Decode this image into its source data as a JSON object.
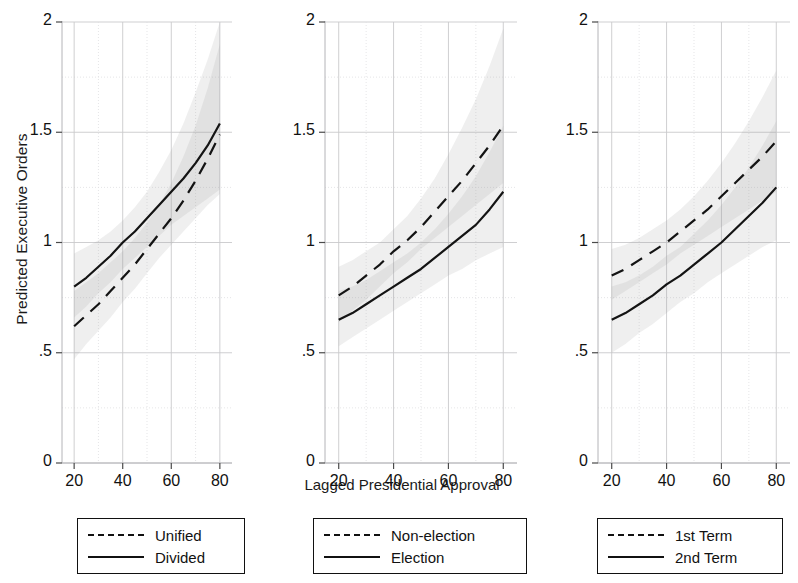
{
  "chart_data": {
    "type": "line",
    "title": "",
    "xlabel": "Lagged Presidential Approval",
    "ylabel": "Predicted Executive Orders",
    "xlim": [
      15,
      85
    ],
    "ylim": [
      0,
      2
    ],
    "xticks": [
      20,
      40,
      60,
      80
    ],
    "xtick_labels": [
      "20",
      "40",
      "60",
      "80"
    ],
    "yticks": [
      0,
      0.5,
      1,
      1.5,
      2
    ],
    "ytick_labels": [
      "0",
      ".5",
      "1",
      "1.5",
      "2"
    ],
    "grid": true,
    "legend_position": "below-each-panel",
    "panel_count": 3,
    "x": [
      20,
      25,
      30,
      35,
      40,
      45,
      50,
      55,
      60,
      65,
      70,
      75,
      80
    ],
    "panels": [
      {
        "name": "government-control",
        "legend": [
          {
            "label": "Unified",
            "style": "dashed"
          },
          {
            "label": "Divided",
            "style": "solid"
          }
        ],
        "series": [
          {
            "name": "Unified",
            "style": "dashed",
            "values": [
              0.62,
              0.67,
              0.72,
              0.78,
              0.84,
              0.9,
              0.97,
              1.04,
              1.11,
              1.19,
              1.28,
              1.38,
              1.49
            ],
            "ci_lower": [
              0.47,
              0.54,
              0.6,
              0.66,
              0.73,
              0.79,
              0.86,
              0.93,
              0.99,
              1.05,
              1.11,
              1.17,
              1.22
            ],
            "ci_upper": [
              0.78,
              0.82,
              0.86,
              0.91,
              0.96,
              1.02,
              1.09,
              1.17,
              1.27,
              1.39,
              1.53,
              1.7,
              1.9
            ]
          },
          {
            "name": "Divided",
            "style": "solid",
            "values": [
              0.8,
              0.84,
              0.89,
              0.94,
              1.0,
              1.05,
              1.11,
              1.17,
              1.23,
              1.29,
              1.36,
              1.44,
              1.54
            ],
            "ci_lower": [
              0.66,
              0.71,
              0.77,
              0.82,
              0.88,
              0.93,
              0.98,
              1.03,
              1.08,
              1.12,
              1.16,
              1.2,
              1.24
            ],
            "ci_upper": [
              0.95,
              0.98,
              1.01,
              1.05,
              1.1,
              1.16,
              1.23,
              1.32,
              1.42,
              1.54,
              1.68,
              1.83,
              2.0
            ]
          }
        ]
      },
      {
        "name": "election-year",
        "legend": [
          {
            "label": "Non-election",
            "style": "dashed"
          },
          {
            "label": "Election",
            "style": "solid"
          }
        ],
        "series": [
          {
            "name": "Non-election",
            "style": "dashed",
            "values": [
              0.76,
              0.8,
              0.85,
              0.9,
              0.96,
              1.01,
              1.07,
              1.14,
              1.21,
              1.28,
              1.36,
              1.44,
              1.53
            ],
            "ci_lower": [
              0.64,
              0.69,
              0.74,
              0.8,
              0.86,
              0.91,
              0.97,
              1.02,
              1.07,
              1.12,
              1.17,
              1.22,
              1.27
            ],
            "ci_upper": [
              0.89,
              0.92,
              0.96,
              1.0,
              1.06,
              1.12,
              1.2,
              1.29,
              1.4,
              1.52,
              1.65,
              1.8,
              1.97
            ]
          },
          {
            "name": "Election",
            "style": "solid",
            "values": [
              0.65,
              0.68,
              0.72,
              0.76,
              0.8,
              0.84,
              0.88,
              0.93,
              0.98,
              1.03,
              1.08,
              1.15,
              1.23
            ],
            "ci_lower": [
              0.53,
              0.57,
              0.61,
              0.65,
              0.69,
              0.73,
              0.77,
              0.81,
              0.85,
              0.88,
              0.92,
              0.95,
              0.98
            ],
            "ci_upper": [
              0.78,
              0.8,
              0.83,
              0.87,
              0.91,
              0.95,
              1.0,
              1.06,
              1.13,
              1.21,
              1.3,
              1.41,
              1.53
            ]
          }
        ]
      },
      {
        "name": "presidential-term",
        "legend": [
          {
            "label": "1st Term",
            "style": "dashed"
          },
          {
            "label": "2nd Term",
            "style": "solid"
          }
        ],
        "series": [
          {
            "name": "1st Term",
            "style": "dashed",
            "values": [
              0.85,
              0.88,
              0.92,
              0.96,
              1.0,
              1.05,
              1.1,
              1.15,
              1.21,
              1.27,
              1.33,
              1.39,
              1.46
            ],
            "ci_lower": [
              0.74,
              0.78,
              0.82,
              0.86,
              0.9,
              0.95,
              0.99,
              1.03,
              1.07,
              1.11,
              1.15,
              1.19,
              1.23
            ],
            "ci_upper": [
              0.97,
              0.99,
              1.02,
              1.06,
              1.1,
              1.15,
              1.21,
              1.28,
              1.36,
              1.45,
              1.55,
              1.66,
              1.78
            ]
          },
          {
            "name": "2nd Term",
            "style": "solid",
            "values": [
              0.65,
              0.68,
              0.72,
              0.76,
              0.81,
              0.85,
              0.9,
              0.95,
              1.0,
              1.06,
              1.12,
              1.18,
              1.25
            ],
            "ci_lower": [
              0.5,
              0.54,
              0.59,
              0.63,
              0.68,
              0.73,
              0.77,
              0.82,
              0.86,
              0.9,
              0.94,
              0.98,
              1.01
            ],
            "ci_upper": [
              0.8,
              0.82,
              0.85,
              0.89,
              0.94,
              0.98,
              1.04,
              1.1,
              1.17,
              1.25,
              1.34,
              1.44,
              1.55
            ]
          }
        ]
      }
    ]
  }
}
